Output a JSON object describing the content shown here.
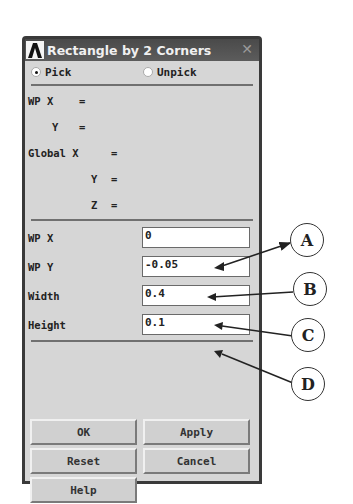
{
  "dialog": {
    "title": "Rectangle by 2 Corners",
    "logo_icon": "ansys-logo-icon",
    "close_icon": "close-icon"
  },
  "mode": {
    "pick_label": "Pick",
    "unpick_label": "Unpick",
    "selected": "Pick"
  },
  "readout": {
    "wp_x": "WP X",
    "wp_y": "Y",
    "global_x": "Global X",
    "global_y": "Y",
    "global_z": "Z",
    "eq": "="
  },
  "inputs": [
    {
      "label": "WP X",
      "value": "0"
    },
    {
      "label": "WP Y",
      "value": "-0.05"
    },
    {
      "label": "Width",
      "value": "0.4"
    },
    {
      "label": "Height",
      "value": "0.1"
    }
  ],
  "buttons": {
    "ok": "OK",
    "apply": "Apply",
    "reset": "Reset",
    "cancel": "Cancel",
    "help": "Help"
  },
  "callouts": [
    "A",
    "B",
    "C",
    "D"
  ]
}
